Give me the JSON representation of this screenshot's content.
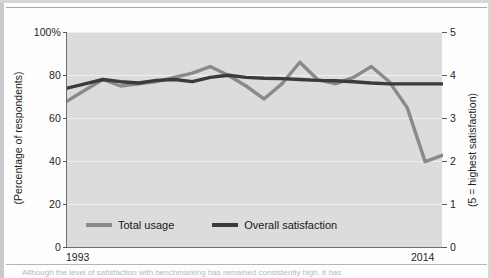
{
  "colors": {
    "total_usage": "#8a8a8a",
    "overall_satisfaction": "#3b3b3b",
    "plot_background": "#dcdcdc",
    "gridline": "#efefef",
    "axis": "#6f6f6f"
  },
  "axes": {
    "left_title": "(Percentage of respondents)",
    "right_title": "(5 = highest satisfaction)",
    "left_ticks": [
      "100%",
      "80",
      "60",
      "40",
      "20",
      "0"
    ],
    "right_ticks": [
      "5",
      "4",
      "3",
      "2",
      "1",
      "0"
    ],
    "x_start": "1993",
    "x_end": "2014"
  },
  "legend": {
    "items": [
      {
        "label": "Total usage",
        "color": "#8a8a8a"
      },
      {
        "label": "Overall satisfaction",
        "color": "#3b3b3b"
      }
    ]
  },
  "caption": {
    "text": "Although the level of satisfaction with benchmarking has remained consistently high, it has"
  },
  "chart_data": {
    "type": "line",
    "title": "",
    "xlabel": "",
    "ylabel": "(Percentage of respondents)",
    "y2label": "(5 = highest satisfaction)",
    "ylim": [
      0,
      100
    ],
    "y2lim": [
      0,
      5
    ],
    "yticks": [
      0,
      20,
      40,
      60,
      80,
      100
    ],
    "y2ticks": [
      0,
      1,
      2,
      3,
      4,
      5
    ],
    "grid": true,
    "legend_position": "bottom-center",
    "x": [
      1993,
      1994,
      1995,
      1996,
      1997,
      1998,
      1999,
      2000,
      2001,
      2002,
      2003,
      2004,
      2005,
      2006,
      2007,
      2008,
      2009,
      2010,
      2011,
      2012,
      2013,
      2014
    ],
    "series": [
      {
        "name": "Total usage",
        "axis": "left",
        "color": "#8a8a8a",
        "units": "percent",
        "values": [
          68,
          73,
          78,
          75,
          76,
          77,
          79,
          81,
          84,
          80,
          75,
          69,
          76,
          86,
          78,
          76,
          79,
          84,
          77,
          65,
          40,
          43
        ]
      },
      {
        "name": "Overall satisfaction",
        "axis": "right",
        "color": "#3b3b3b",
        "units": "score",
        "values": [
          3.7,
          3.8,
          3.9,
          3.85,
          3.82,
          3.88,
          3.9,
          3.85,
          3.95,
          4.0,
          3.95,
          3.93,
          3.92,
          3.9,
          3.88,
          3.87,
          3.85,
          3.82,
          3.8,
          3.8,
          3.8,
          3.8
        ]
      }
    ]
  }
}
